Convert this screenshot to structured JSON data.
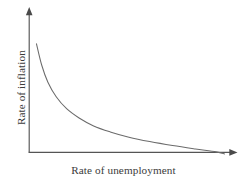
{
  "figure": {
    "width": 247,
    "height": 185,
    "background": "#ffffff",
    "line_color": "#6b6b6b",
    "axis_color": "#555555",
    "text_color": "#3b3b3b"
  },
  "chart_data": {
    "type": "line",
    "title": "",
    "subtitle": "",
    "xlabel": "Rate of unemployment",
    "ylabel": "Rate of inflation",
    "grid": false,
    "legend": null,
    "axis_style": "arrow-headed open axes, no tick marks, no tick labels",
    "xlim": [
      0,
      1
    ],
    "ylim": [
      0,
      1
    ],
    "annotations": [],
    "series": [
      {
        "name": "Phillips curve",
        "shape": "convex decreasing hyperbola",
        "x": [
          0.035,
          0.06,
          0.09,
          0.13,
          0.18,
          0.24,
          0.31,
          0.39,
          0.48,
          0.58,
          0.69,
          0.8,
          0.9,
          0.94
        ],
        "y": [
          0.82,
          0.66,
          0.53,
          0.42,
          0.33,
          0.26,
          0.2,
          0.155,
          0.115,
          0.082,
          0.052,
          0.026,
          0.004,
          -0.012
        ]
      }
    ]
  },
  "labels": {
    "x_axis": "Rate of unemployment",
    "y_axis": "Rate of inflation"
  }
}
